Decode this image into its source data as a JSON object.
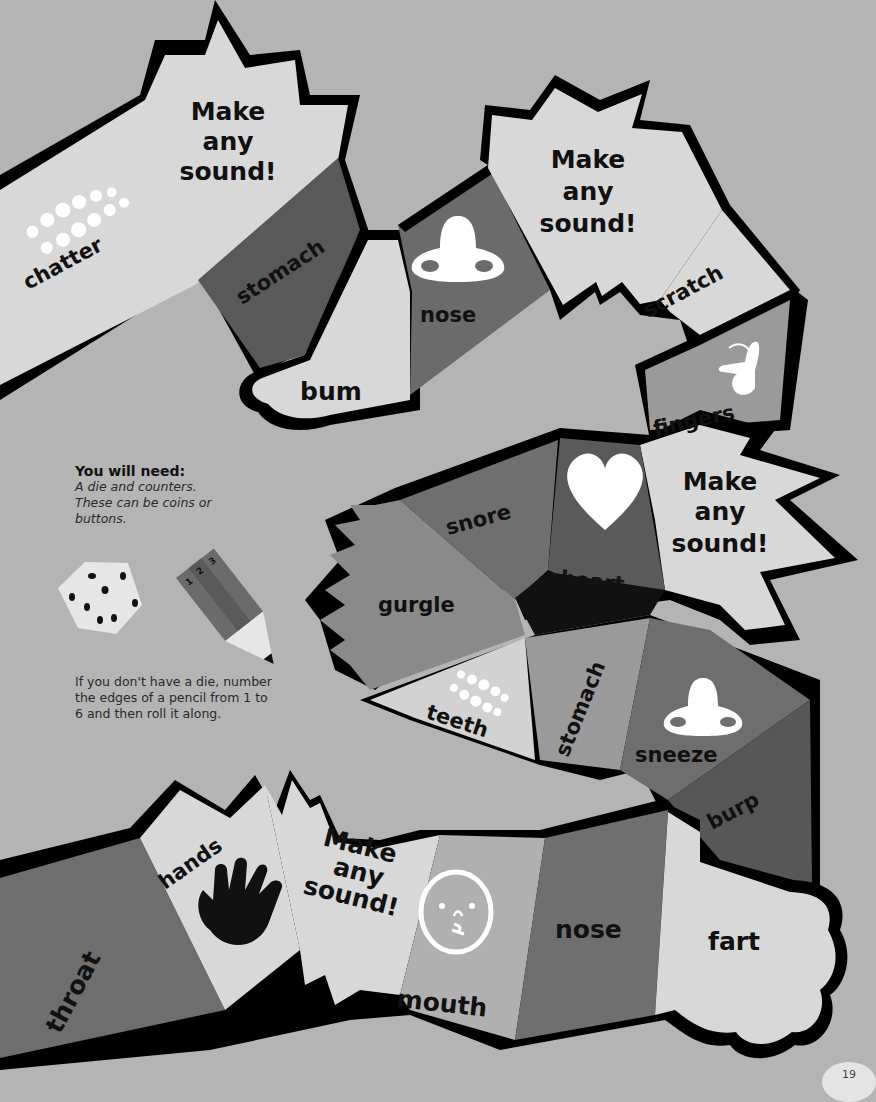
{
  "board": {
    "colors": {
      "background": "#b4b4b4",
      "light": "#d6d6d6",
      "mid": "#8d8d8d",
      "dark": "#666666",
      "darker": "#4f4f4f",
      "outline": "#000000",
      "icon": "#ffffff"
    },
    "spaces": [
      {
        "id": "chatter",
        "label": "chatter",
        "icon": "teeth-icon"
      },
      {
        "id": "make-any-sound-1",
        "label": "Make any sound!",
        "lines": [
          "Make",
          "any",
          "sound!"
        ]
      },
      {
        "id": "stomach-1",
        "label": "stomach"
      },
      {
        "id": "bum",
        "label": "bum"
      },
      {
        "id": "nose-1",
        "label": "nose",
        "icon": "nose-icon"
      },
      {
        "id": "make-any-sound-2",
        "label": "Make any sound!",
        "lines": [
          "Make",
          "any",
          "sound!"
        ]
      },
      {
        "id": "scratch",
        "label": "scratch"
      },
      {
        "id": "fingers",
        "label": "fingers",
        "icon": "finger-snap-icon"
      },
      {
        "id": "make-any-sound-3",
        "label": "Make any sound!",
        "lines": [
          "Make",
          "any",
          "sound!"
        ]
      },
      {
        "id": "heart",
        "label": "heart",
        "icon": "heart-icon"
      },
      {
        "id": "snore",
        "label": "snore"
      },
      {
        "id": "gurgle",
        "label": "gurgle"
      },
      {
        "id": "teeth",
        "label": "teeth",
        "icon": "teeth-icon"
      },
      {
        "id": "stomach-2",
        "label": "stomach"
      },
      {
        "id": "sneeze",
        "label": "sneeze",
        "icon": "nose-icon"
      },
      {
        "id": "burp",
        "label": "burp"
      },
      {
        "id": "fart",
        "label": "fart"
      },
      {
        "id": "nose-2",
        "label": "nose"
      },
      {
        "id": "mouth",
        "label": "mouth",
        "icon": "face-icon"
      },
      {
        "id": "make-any-sound-4",
        "label": "Make any sound!",
        "lines": [
          "Make",
          "any",
          "sound!"
        ]
      },
      {
        "id": "hands",
        "label": "hands",
        "icon": "hand-icon"
      },
      {
        "id": "throat",
        "label": "throat"
      }
    ]
  },
  "info": {
    "heading": "You will need:",
    "text": "A die and counters. These can be coins or buttons.",
    "pencil_numbers": [
      "1",
      "2",
      "3"
    ],
    "tip": "If you don't have a die, number the edges of a pencil from 1 to 6 and then roll it along."
  },
  "page_number": "19"
}
